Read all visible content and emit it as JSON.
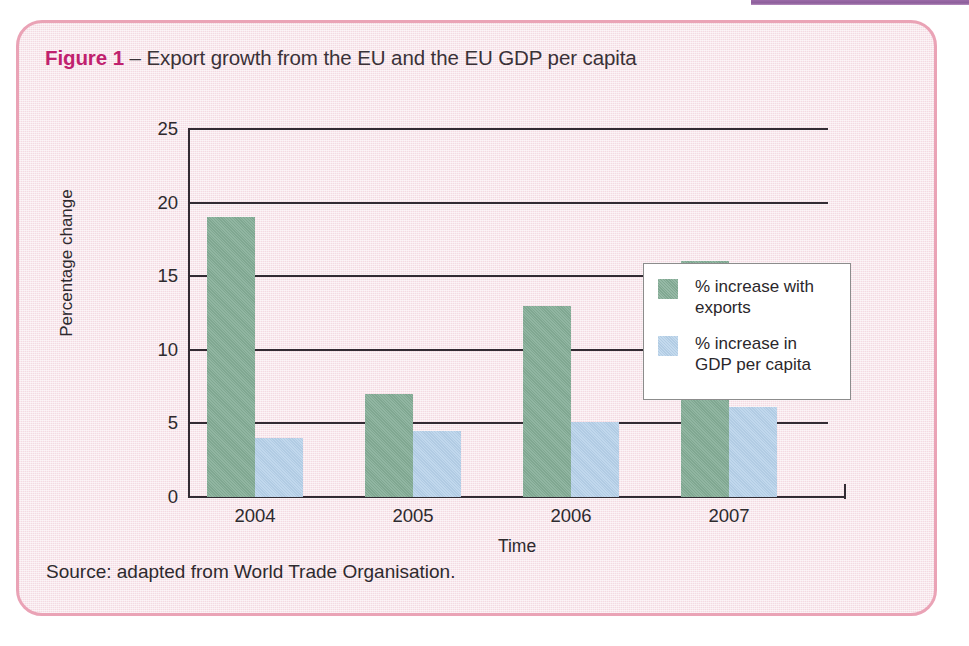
{
  "page": {
    "top_rule_color": "#8c5e9a",
    "panel_bg_color": "#f8e9ee",
    "panel_border_color": "#eaa3b6"
  },
  "figure": {
    "number_label": "Figure 1",
    "dash": " – ",
    "title_text": "Export growth from the EU and the EU GDP per capita",
    "number_color": "#c0216e",
    "source": "Source: adapted from World Trade Organisation."
  },
  "chart_data": {
    "type": "bar",
    "title": "Export growth from the EU and the EU GDP per capita",
    "xlabel": "Time",
    "ylabel": "Percentage change",
    "categories": [
      "2004",
      "2005",
      "2006",
      "2007"
    ],
    "ylim": [
      0,
      25
    ],
    "yticks": [
      0,
      5,
      10,
      15,
      20,
      25
    ],
    "ytick_labels": [
      "0",
      "5",
      "10",
      "15",
      "20",
      "25"
    ],
    "grid": true,
    "legend_position": "upper center",
    "series": [
      {
        "name": "% increase with exports",
        "color": "#85ae97",
        "values": [
          19,
          7,
          13,
          16
        ]
      },
      {
        "name": "% increase in GDP per capita",
        "color": "#b7d2ea",
        "values": [
          4,
          4.5,
          5.1,
          6.1
        ]
      }
    ]
  }
}
